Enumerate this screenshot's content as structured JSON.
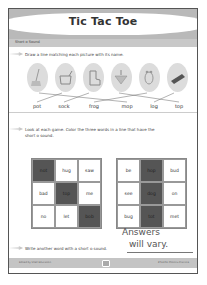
{
  "title": "Tic Tac Toe",
  "subhead": "Short o Sound",
  "instructions": [
    "Draw a line matching each picture with its name.",
    "Look at each game. Color the three words in a line that have the",
    "short o sound.",
    "Write another word with a short o sound."
  ],
  "pictures": [
    {
      "icon": "mop-icon"
    },
    {
      "icon": "pot-icon"
    },
    {
      "icon": "sock-icon"
    },
    {
      "icon": "top-icon"
    },
    {
      "icon": "frog-icon"
    },
    {
      "icon": "log-icon"
    }
  ],
  "words": [
    "pot",
    "sock",
    "frog",
    "mop",
    "log",
    "top"
  ],
  "grid1": {
    "cells": [
      "not",
      "hug",
      "saw",
      "bad",
      "top",
      "me",
      "no",
      "let",
      "bob"
    ],
    "dark": [
      0,
      4,
      8
    ]
  },
  "grid2": {
    "cells": [
      "be",
      "hop",
      "bud",
      "see",
      "dog",
      "on",
      "bug",
      "tot",
      "met"
    ],
    "dark": [
      1,
      4,
      7
    ]
  },
  "answer": {
    "line1": "Answers",
    "line2": "will vary."
  },
  "footer": {
    "left": "Edited by Shell Education",
    "right": "#50456 Phonics Practice"
  }
}
